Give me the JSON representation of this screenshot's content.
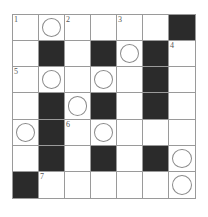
{
  "puzzle": {
    "rows": 7,
    "cols": 7,
    "colors": {
      "block": "#2b2b2b",
      "line": "#9a9a9a",
      "circle": "#8a8a8a"
    },
    "grid": [
      [
        "W1",
        "O",
        "W2",
        "W",
        "W3",
        "W",
        "B"
      ],
      [
        "W",
        "B",
        "W",
        "B",
        "O",
        "B",
        "W4"
      ],
      [
        "W5",
        "O",
        "W",
        "O",
        "W",
        "B",
        "W"
      ],
      [
        "W",
        "B",
        "O",
        "B",
        "W",
        "B",
        "W"
      ],
      [
        "O",
        "B",
        "W6",
        "O",
        "W",
        "W",
        "W"
      ],
      [
        "W",
        "B",
        "W",
        "B",
        "W",
        "B",
        "O"
      ],
      [
        "B",
        "W7",
        "W",
        "W",
        "W",
        "W",
        "O"
      ]
    ],
    "numbers": [
      {
        "row": 0,
        "col": 0,
        "label": "1"
      },
      {
        "row": 0,
        "col": 2,
        "label": "2"
      },
      {
        "row": 0,
        "col": 4,
        "label": "3"
      },
      {
        "row": 1,
        "col": 6,
        "label": "4"
      },
      {
        "row": 2,
        "col": 0,
        "label": "5"
      },
      {
        "row": 4,
        "col": 2,
        "label": "6"
      },
      {
        "row": 6,
        "col": 1,
        "label": "7"
      }
    ]
  }
}
